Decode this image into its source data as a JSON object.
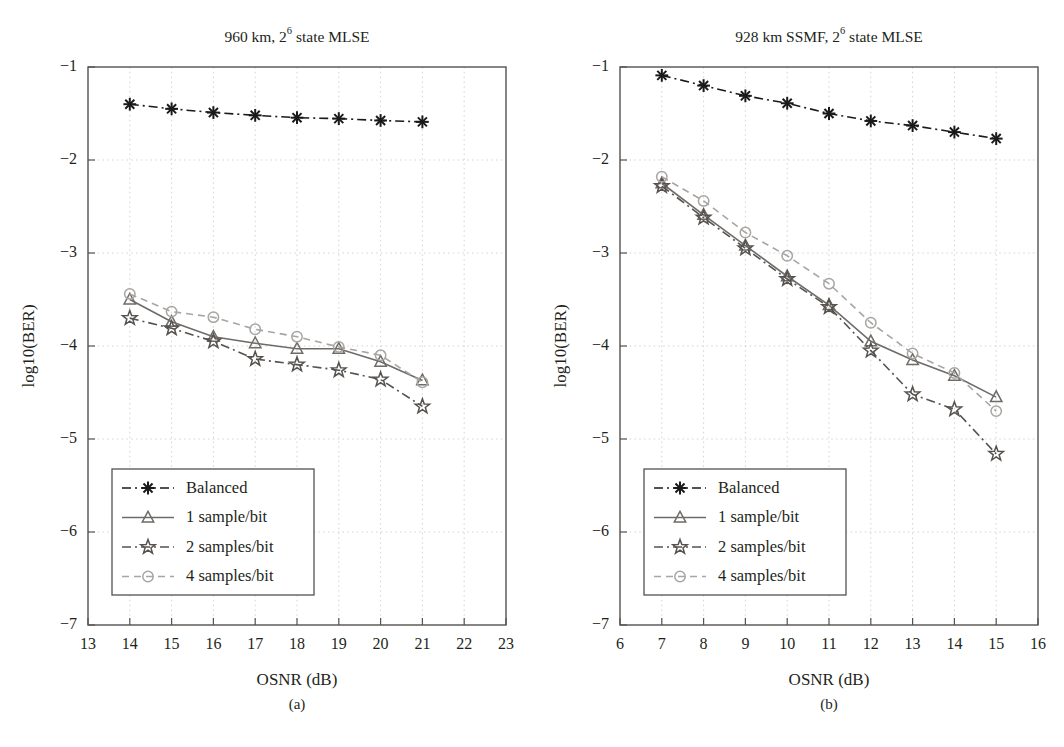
{
  "figure": {
    "caption_a": "(a)",
    "caption_b": "(b)"
  },
  "chart_data": [
    {
      "type": "line",
      "panel": "a",
      "title": "960 km, 2⁶ state MLSE",
      "title_main": "960 km, 2",
      "title_sup": "6",
      "title_tail": " state MLSE",
      "xlabel": "OSNR (dB)",
      "ylabel": "log10(BER)",
      "xlim": [
        13,
        23
      ],
      "ylim": [
        -7,
        -1
      ],
      "xticks": [
        13,
        14,
        15,
        16,
        17,
        18,
        19,
        20,
        21,
        22,
        23
      ],
      "yticks": [
        -1,
        -2,
        -3,
        -4,
        -5,
        -6,
        -7
      ],
      "grid": true,
      "legend_position": "lower-left",
      "series": [
        {
          "name": "Balanced",
          "marker": "asterisk",
          "linestyle": "dashdot",
          "color": "#1a1a1a",
          "x": [
            14,
            15,
            16,
            17,
            18,
            19,
            20,
            21
          ],
          "values": [
            -1.4,
            -1.45,
            -1.49,
            -1.52,
            -1.545,
            -1.555,
            -1.575,
            -1.59
          ]
        },
        {
          "name": "1 sample/bit",
          "marker": "triangle",
          "linestyle": "solid",
          "color": "#6e6b68",
          "x": [
            14,
            15,
            16,
            17,
            18,
            19,
            20,
            21
          ],
          "values": [
            -3.5,
            -3.74,
            -3.9,
            -3.97,
            -4.03,
            -4.03,
            -4.17,
            -4.37
          ]
        },
        {
          "name": "2 samples/bit",
          "marker": "star",
          "linestyle": "dashdot",
          "color": "#55524f",
          "x": [
            14,
            15,
            16,
            17,
            18,
            19,
            20,
            21
          ],
          "values": [
            -3.7,
            -3.81,
            -3.95,
            -4.14,
            -4.2,
            -4.26,
            -4.36,
            -4.65
          ]
        },
        {
          "name": "4 samples/bit",
          "marker": "circle",
          "linestyle": "dashed",
          "color": "#a8a5a2",
          "x": [
            14,
            15,
            16,
            17,
            18,
            19,
            20,
            21
          ],
          "values": [
            -3.44,
            -3.63,
            -3.69,
            -3.82,
            -3.9,
            -4.01,
            -4.1,
            -4.39
          ]
        }
      ]
    },
    {
      "type": "line",
      "panel": "b",
      "title": "928 km SSMF, 2⁶ state MLSE",
      "title_main": "928 km SSMF, 2",
      "title_sup": "6",
      "title_tail": " state MLSE",
      "xlabel": "OSNR (dB)",
      "ylabel": "log10(BER)",
      "xlim": [
        6,
        16
      ],
      "ylim": [
        -7,
        -1
      ],
      "xticks": [
        6,
        7,
        8,
        9,
        10,
        11,
        12,
        13,
        14,
        15,
        16
      ],
      "yticks": [
        -1,
        -2,
        -3,
        -4,
        -5,
        -6,
        -7
      ],
      "grid": true,
      "legend_position": "lower-left",
      "series": [
        {
          "name": "Balanced",
          "marker": "asterisk",
          "linestyle": "dashdot",
          "color": "#1a1a1a",
          "x": [
            7,
            8,
            9,
            10,
            11,
            12,
            13,
            14,
            15
          ],
          "values": [
            -1.09,
            -1.2,
            -1.31,
            -1.39,
            -1.5,
            -1.58,
            -1.63,
            -1.7,
            -1.77
          ]
        },
        {
          "name": "1 sample/bit",
          "marker": "triangle",
          "linestyle": "solid",
          "color": "#6e6b68",
          "x": [
            7,
            8,
            9,
            10,
            11,
            12,
            13,
            14,
            15
          ],
          "values": [
            -2.25,
            -2.59,
            -2.92,
            -3.25,
            -3.56,
            -3.95,
            -4.15,
            -4.32,
            -4.55
          ]
        },
        {
          "name": "2 samples/bit",
          "marker": "star",
          "linestyle": "dashdot",
          "color": "#55524f",
          "x": [
            7,
            8,
            9,
            10,
            11,
            12,
            13,
            14,
            15
          ],
          "values": [
            -2.28,
            -2.62,
            -2.95,
            -3.28,
            -3.58,
            -4.05,
            -4.52,
            -4.68,
            -5.16
          ]
        },
        {
          "name": "4 samples/bit",
          "marker": "circle",
          "linestyle": "dashed",
          "color": "#a8a5a2",
          "x": [
            7,
            8,
            9,
            10,
            11,
            12,
            13,
            14,
            15
          ],
          "values": [
            -2.18,
            -2.44,
            -2.78,
            -3.03,
            -3.33,
            -3.75,
            -4.08,
            -4.29,
            -4.7
          ]
        }
      ]
    }
  ]
}
